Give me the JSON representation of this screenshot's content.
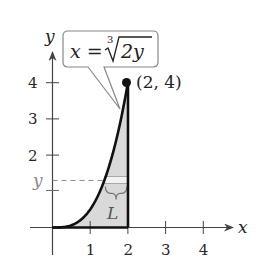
{
  "figure": {
    "callout_equation": {
      "lhs": "x =",
      "index": "3",
      "radicand": "2y"
    },
    "point_label": "(2, 4)",
    "axis_labels": {
      "x": "x",
      "y": "y"
    },
    "x_ticks": [
      "1",
      "2",
      "3",
      "4"
    ],
    "y_ticks": [
      "2",
      "3",
      "4"
    ],
    "y_marker_label": "y",
    "region_label": "L",
    "colors": {
      "curve": "#111111",
      "axis": "#444444",
      "fill": "#d9d9d9",
      "strip": "#f2f2f2",
      "marker_label": "#888888"
    }
  },
  "chart_data": {
    "type": "line",
    "title": "",
    "xlabel": "x",
    "ylabel": "y",
    "xlim": [
      0,
      4.5
    ],
    "ylim": [
      0,
      4.6
    ],
    "x_ticks": [
      1,
      2,
      3,
      4
    ],
    "y_ticks": [
      2,
      3,
      4
    ],
    "grid": false,
    "series": [
      {
        "name": "x = cbrt(2y)",
        "equation": "x = (2y)^(1/3)",
        "x": [
          0,
          0.5,
          1,
          1.25,
          1.5,
          1.75,
          2
        ],
        "values": [
          0,
          0.0625,
          0.5,
          0.977,
          1.6875,
          2.68,
          4
        ]
      }
    ],
    "annotations": [
      {
        "text": "(2, 4)",
        "x": 2,
        "y": 4,
        "type": "point"
      },
      {
        "text": "x = ∛(2y)",
        "type": "callout",
        "points_to": [
          1.8,
          3.3
        ]
      },
      {
        "text": "y",
        "type": "dashed-level",
        "y": 1.3
      },
      {
        "text": "L",
        "type": "strip-length",
        "y": 1.3,
        "from_x": 1.38,
        "to_x": 2
      }
    ],
    "shaded_region": "between curve x=(2y)^(1/3), line x=2, and x-axis, 0<=y<=4"
  }
}
